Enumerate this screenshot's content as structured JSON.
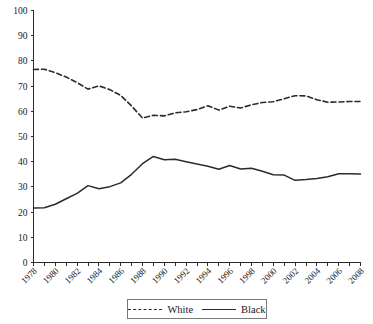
{
  "chart_data": {
    "type": "line",
    "title": "",
    "subtitle": "",
    "xlabel": "",
    "ylabel": "",
    "xlim": [
      1978,
      2008
    ],
    "ylim": [
      0,
      100
    ],
    "ytick_step": 10,
    "yticks": [
      0,
      10,
      20,
      30,
      40,
      50,
      60,
      70,
      80,
      90,
      100
    ],
    "x": [
      1978,
      1979,
      1980,
      1981,
      1982,
      1983,
      1984,
      1985,
      1986,
      1987,
      1988,
      1989,
      1990,
      1991,
      1992,
      1993,
      1994,
      1995,
      1996,
      1997,
      1998,
      1999,
      2000,
      2001,
      2002,
      2003,
      2004,
      2005,
      2006,
      2007,
      2008
    ],
    "xtick_labels": [
      "1978",
      "1980",
      "1982",
      "1984",
      "1986",
      "1988",
      "1990",
      "1992",
      "1994",
      "1996",
      "1998",
      "2000",
      "2002",
      "2004",
      "2006",
      "2008"
    ],
    "xtick_label_step": 2,
    "xtick_minor_every": 1,
    "grid": false,
    "legend_position": "bottom-center",
    "series": [
      {
        "name": "White",
        "style": "dashed",
        "color": "#2b2b2b",
        "values": [
          76.6,
          76.7,
          75.3,
          73.6,
          71.4,
          68.8,
          70.1,
          68.6,
          66.3,
          62.1,
          57.3,
          58.4,
          58.2,
          59.4,
          59.8,
          60.7,
          62.2,
          60.5,
          62.0,
          61.3,
          62.6,
          63.5,
          63.8,
          65.0,
          66.2,
          66.1,
          64.6,
          63.6,
          63.7,
          63.9,
          63.9
        ]
      },
      {
        "name": "Black",
        "style": "solid",
        "color": "#2b2b2b",
        "values": [
          21.6,
          21.7,
          23.1,
          25.3,
          27.4,
          30.5,
          29.3,
          30.1,
          31.6,
          35.0,
          39.2,
          42.1,
          40.8,
          41.0,
          40.0,
          39.1,
          38.2,
          37.0,
          38.5,
          37.1,
          37.4,
          36.2,
          34.8,
          34.7,
          32.6,
          32.9,
          33.3,
          34.0,
          35.2,
          35.2,
          35.1
        ]
      }
    ]
  },
  "legend": {
    "items": [
      {
        "label": "White",
        "style": "dashed"
      },
      {
        "label": "Black",
        "style": "solid"
      }
    ]
  }
}
